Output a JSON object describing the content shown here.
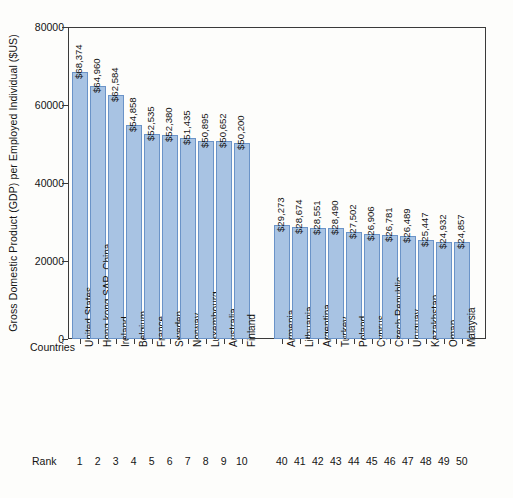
{
  "chart_data": {
    "type": "bar",
    "title": "",
    "xlabel": "Countries",
    "ylabel": "Gross Domestic Product (GDP) per Employed Individual ($US)",
    "ylim": [
      0,
      80000
    ],
    "yticks": [
      0,
      20000,
      40000,
      60000,
      80000
    ],
    "ytick_labels": [
      "0",
      "20000",
      "40000",
      "60000",
      "80000"
    ],
    "grid": false,
    "legend": null,
    "rank_caption": "Rank",
    "categories": [
      "United States",
      "Hong kong SAR, China",
      "Ireland",
      "Belgium",
      "France",
      "Sweden",
      "Norway",
      "Luxembourg",
      "Australia",
      "Finland",
      "Armenia",
      "Lithuania",
      "Argentina",
      "Turkey",
      "Poland",
      "Cyprus",
      "Czech Republic",
      "Uruguay",
      "Kazakhstan",
      "Oman",
      "Malaysia"
    ],
    "ranks": [
      "1",
      "2",
      "3",
      "4",
      "5",
      "6",
      "7",
      "8",
      "9",
      "10",
      "40",
      "41",
      "42",
      "43",
      "44",
      "45",
      "46",
      "47",
      "48",
      "49",
      "50"
    ],
    "values": [
      68374,
      64960,
      62584,
      54858,
      52535,
      52380,
      51435,
      50895,
      50652,
      50200,
      29273,
      28674,
      28551,
      28490,
      27502,
      26906,
      26781,
      26489,
      25447,
      24932,
      24857
    ],
    "value_labels": [
      "$68,374",
      "$64,960",
      "$62,584",
      "$54,858",
      "$52,535",
      "$52,380",
      "$51,435",
      "$50,895",
      "$50,652",
      "$50,200",
      "$29,273",
      "$28,674",
      "$28,551",
      "$28,490",
      "$27,502",
      "$26,906",
      "$26,781",
      "$26,489",
      "$25,447",
      "$24,932",
      "$24,857"
    ],
    "group_break_after_index": 9,
    "colors": {
      "bar_fill": "#a8c3e3",
      "bar_edge": "#6a93c8",
      "axis": "#3a3a3a",
      "text": "#141414",
      "background": "#fdfdfb"
    }
  }
}
